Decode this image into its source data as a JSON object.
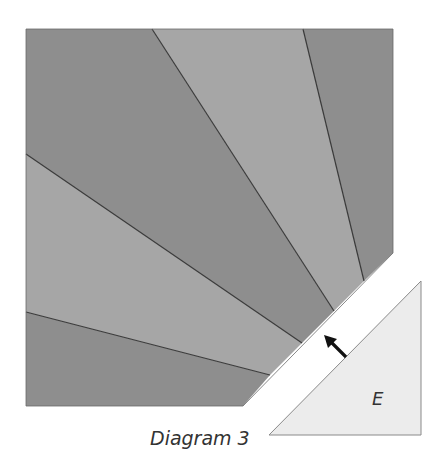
{
  "diagram": {
    "caption": "Diagram 3",
    "piece_label": "E",
    "colors": {
      "dark_wedge": "#8e8e8e",
      "light_wedge": "#a6a6a6",
      "piece_fill": "#ececec",
      "seam_line": "#3a3a3a",
      "arrow": "#111111",
      "background": "#ffffff"
    },
    "block": {
      "outline": [
        [
          26,
          29
        ],
        [
          393,
          29
        ],
        [
          393,
          253
        ],
        [
          243,
          406
        ],
        [
          26,
          406
        ]
      ],
      "wedges": [
        {
          "name": "wedge-1",
          "shade": "dark",
          "points": [
            [
              26,
              29
            ],
            [
              152,
              29
            ],
            [
              334,
              311
            ],
            [
              302,
              343
            ],
            [
              26,
              154
            ]
          ]
        },
        {
          "name": "wedge-2",
          "shade": "light",
          "points": [
            [
              152,
              29
            ],
            [
              303,
              29
            ],
            [
              364,
              281
            ],
            [
              334,
              311
            ]
          ]
        },
        {
          "name": "wedge-3",
          "shade": "dark",
          "points": [
            [
              303,
              29
            ],
            [
              393,
              29
            ],
            [
              393,
              253
            ],
            [
              364,
              281
            ]
          ]
        },
        {
          "name": "wedge-4",
          "shade": "light",
          "points": [
            [
              26,
              154
            ],
            [
              302,
              343
            ],
            [
              270,
              375
            ],
            [
              26,
              312
            ]
          ]
        },
        {
          "name": "wedge-5",
          "shade": "dark",
          "points": [
            [
              26,
              312
            ],
            [
              270,
              375
            ],
            [
              243,
              406
            ],
            [
              26,
              406
            ]
          ]
        }
      ]
    },
    "piece_e": {
      "points": [
        [
          421,
          281
        ],
        [
          421,
          435
        ],
        [
          269,
          435
        ]
      ]
    },
    "arrow": {
      "from": [
        346,
        357
      ],
      "to": [
        325,
        336
      ]
    }
  }
}
